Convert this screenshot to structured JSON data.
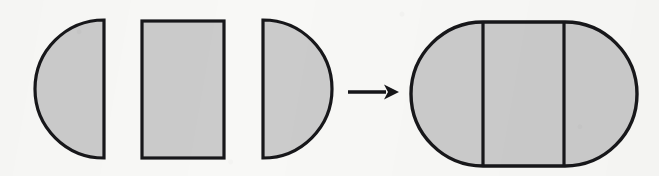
{
  "figure": {
    "title": "Three shaded plane pieces combining into a shaded stadium",
    "canvas": {
      "width": 659,
      "height": 176,
      "background_color": "#f8f8f6"
    },
    "style": {
      "fill_color": "#cbcbcb",
      "stroke_color": "#17171a",
      "stroke_width": 3.2
    },
    "relation_symbol": "arrow-right",
    "pieces": [
      {
        "id": "piece-left-half-disc",
        "name": "left-half-disc",
        "shape": "semicircle",
        "flat_edge": "right",
        "bulge_direction": "left",
        "x_left": 33,
        "x_right": 104,
        "y_top": 20,
        "y_bottom": 158,
        "radius": 69,
        "height": 138
      },
      {
        "id": "piece-rectangle",
        "name": "middle-rectangle",
        "shape": "rectangle",
        "x_left": 142,
        "x_right": 224,
        "y_top": 21,
        "y_bottom": 158,
        "width": 82,
        "height": 137
      },
      {
        "id": "piece-right-half-disc",
        "name": "right-half-disc",
        "shape": "semicircle",
        "flat_edge": "left",
        "bulge_direction": "right",
        "x_left": 263,
        "x_right": 333,
        "y_top": 20,
        "y_bottom": 158,
        "radius": 69,
        "height": 138
      }
    ],
    "arrow": {
      "id": "composition-arrow",
      "direction": "right",
      "x_start": 348,
      "x_end": 398,
      "y": 92,
      "shaft_length": 40,
      "head_length": 14
    },
    "result": {
      "id": "result-stadium",
      "name": "stadium",
      "shape": "stadium",
      "x_left": 411,
      "x_right": 637,
      "y_top": 22,
      "y_bottom": 166,
      "width": 226,
      "height": 144,
      "cap_radius": 72,
      "divider_lines": [
        {
          "id": "divider-left",
          "x": 483,
          "y_top": 22,
          "y_bottom": 166
        },
        {
          "id": "divider-right",
          "x": 563,
          "y_top": 22,
          "y_bottom": 166
        }
      ],
      "regions": [
        {
          "id": "region-left-cap",
          "label": "left half-disc region"
        },
        {
          "id": "region-middle",
          "label": "rectangular region"
        },
        {
          "id": "region-right-cap",
          "label": "right half-disc region"
        }
      ]
    }
  }
}
